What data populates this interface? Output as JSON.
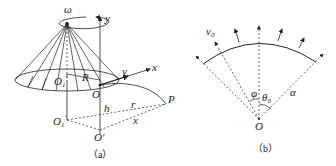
{
  "figure_a": {
    "caption": "（a）",
    "labels": {
      "omega": "ω",
      "y_axis": "y",
      "x_axis": "x",
      "velocity": "v",
      "O1": "O",
      "O1_sub": "1",
      "R": "R",
      "O": "O",
      "h": "h",
      "r": "r",
      "P": "P",
      "O1_prime": "O",
      "O1_prime_sub": "1",
      "O1_prime_mark": "′",
      "O_prime": "O′",
      "x_dist": "x"
    }
  },
  "figure_b": {
    "caption": "（b）",
    "labels": {
      "v0": "v",
      "v0_sub": "0",
      "phi": "φ",
      "theta0": "θ",
      "theta0_sub": "0",
      "alpha": "α",
      "O": "O"
    }
  }
}
